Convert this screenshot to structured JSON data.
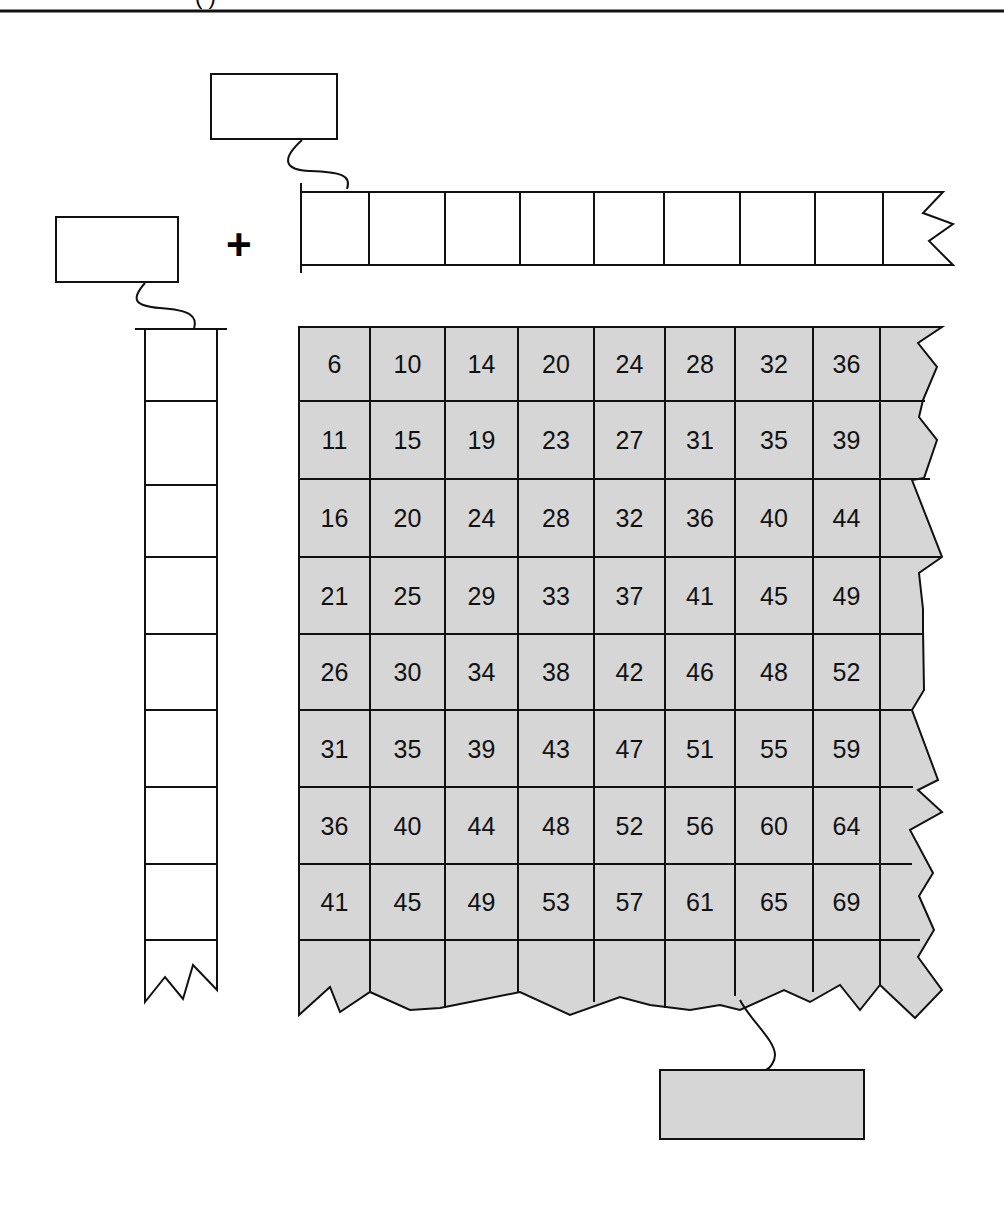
{
  "header": {
    "title_fragment": "( )"
  },
  "operator": "+",
  "colors": {
    "grid_fill": "#d6d6d6",
    "stroke": "#111111",
    "background": "#ffffff"
  },
  "top_label_box": {
    "value": ""
  },
  "left_label_box": {
    "value": ""
  },
  "result_label_box": {
    "value": ""
  },
  "top_strip": {
    "cells": [
      "",
      "",
      "",
      "",
      "",
      "",
      "",
      "",
      ""
    ]
  },
  "left_strip": {
    "cells": [
      "",
      "",
      "",
      "",
      "",
      "",
      "",
      "",
      ""
    ]
  },
  "grid": {
    "rows": [
      [
        "6",
        "10",
        "14",
        "20",
        "24",
        "28",
        "32",
        "36"
      ],
      [
        "11",
        "15",
        "19",
        "23",
        "27",
        "31",
        "35",
        "39"
      ],
      [
        "16",
        "20",
        "24",
        "28",
        "32",
        "36",
        "40",
        "44"
      ],
      [
        "21",
        "25",
        "29",
        "33",
        "37",
        "41",
        "45",
        "49"
      ],
      [
        "26",
        "30",
        "34",
        "38",
        "42",
        "46",
        "48",
        "52"
      ],
      [
        "31",
        "35",
        "39",
        "43",
        "47",
        "51",
        "55",
        "59"
      ],
      [
        "36",
        "40",
        "44",
        "48",
        "52",
        "56",
        "60",
        "64"
      ],
      [
        "41",
        "45",
        "49",
        "53",
        "57",
        "61",
        "65",
        "69"
      ]
    ]
  }
}
